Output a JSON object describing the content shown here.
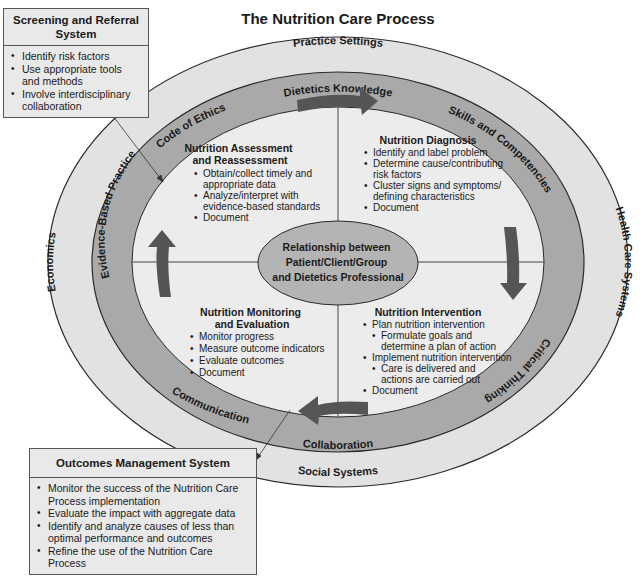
{
  "title": "The Nutrition Care Process",
  "colors": {
    "outer_ring": "#e2e2e2",
    "middle_ring": "#a9a9a9",
    "inner_area": "#ececec",
    "center_ellipse": "#b4b4b4",
    "arrow": "#555555",
    "outline": "#2a2a2a",
    "box_fill": "#e9e9e9"
  },
  "outer_ring": {
    "top": "Practice Settings",
    "right": "Health Care Systems",
    "bottom": "Social Systems",
    "left": "Economics"
  },
  "middle_ring": {
    "top": "Dietetics Knowledge",
    "top_right": "Skills and Competencies",
    "bottom_right": "Critical Thinking",
    "bottom": "Collaboration",
    "bottom_left": "Communication",
    "left": "Evidence-Based Practice",
    "top_left": "Code of Ethics"
  },
  "center": {
    "lines": [
      "Relationship between",
      "Patient/Client/Group",
      "and Dietetics Professional"
    ]
  },
  "quadrants": {
    "assessment": {
      "title": [
        "Nutrition Assessment",
        "and Reassessment"
      ],
      "items": [
        "Obtain/collect timely and",
        "appropriate data",
        "Analyze/interpret with",
        "evidence-based standards",
        "Document"
      ]
    },
    "diagnosis": {
      "title": [
        "Nutrition Diagnosis"
      ],
      "items": [
        "Identify and label problem",
        "Determine cause/contributing",
        "risk factors",
        "Cluster signs and symptoms/",
        "defining characteristics",
        "Document"
      ]
    },
    "intervention": {
      "title": [
        "Nutrition Intervention"
      ],
      "items": [
        "Plan nutrition intervention",
        "Formulate goals and",
        "determine a plan of action",
        "Implement nutrition intervention",
        "Care is delivered and",
        "actions are carried out",
        "Document"
      ]
    },
    "monitoring": {
      "title": [
        "Nutrition Monitoring",
        "and Evaluation"
      ],
      "items": [
        "Monitor progress",
        "Measure outcome indicators",
        "Evaluate outcomes",
        "Document"
      ]
    }
  },
  "screening_box": {
    "title": "Screening and Referral System",
    "items": [
      "Identify risk factors",
      "Use appropriate tools and methods",
      "Involve interdisciplinary collaboration"
    ]
  },
  "outcomes_box": {
    "title": "Outcomes Management System",
    "items": [
      "Monitor the success of the Nutrition Care Process implementation",
      "Evaluate the impact with aggregate data",
      "Identify and analyze causes of less than optimal performance and outcomes",
      "Refine the use of the Nutrition Care Process"
    ]
  },
  "arrows": {
    "icon_top": "arrow-right-icon",
    "icon_right": "arrow-down-icon",
    "icon_bottom": "arrow-left-icon",
    "icon_left": "arrow-up-icon"
  }
}
